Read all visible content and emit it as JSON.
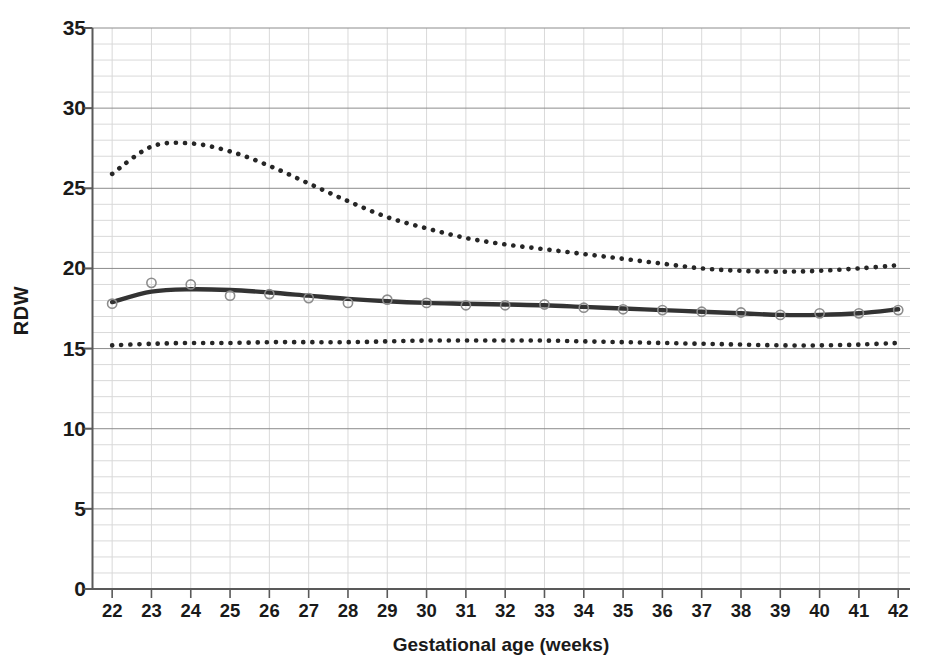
{
  "chart_data": {
    "type": "line",
    "title": "",
    "xlabel": "Gestational age (weeks)",
    "ylabel": "RDW",
    "xlim": [
      21.5,
      42.3
    ],
    "ylim": [
      0,
      35
    ],
    "xtick_labels": [
      "22",
      "23",
      "24",
      "25",
      "26",
      "27",
      "28",
      "29",
      "30",
      "31",
      "32",
      "33",
      "34",
      "35",
      "36",
      "37",
      "38",
      "39",
      "40",
      "41",
      "42"
    ],
    "ytick_labels": [
      "0",
      "5",
      "10",
      "15",
      "20",
      "25",
      "30",
      "35"
    ],
    "xticks": [
      22,
      23,
      24,
      25,
      26,
      27,
      28,
      29,
      30,
      31,
      32,
      33,
      34,
      35,
      36,
      37,
      38,
      39,
      40,
      41,
      42
    ],
    "yticks": [
      0,
      5,
      10,
      15,
      20,
      25,
      30,
      35
    ],
    "grid": true,
    "grid_major_step": 5,
    "grid_minor_step": 1,
    "legend": "none",
    "x": [
      22,
      23,
      24,
      25,
      26,
      27,
      28,
      29,
      30,
      31,
      32,
      33,
      34,
      35,
      36,
      37,
      38,
      39,
      40,
      41,
      42
    ],
    "series": [
      {
        "name": "97th centile",
        "style": "dotted",
        "color": "#262626",
        "values": [
          25.9,
          27.6,
          27.8,
          27.3,
          26.4,
          25.3,
          24.2,
          23.2,
          22.5,
          21.9,
          21.5,
          21.2,
          20.9,
          20.6,
          20.3,
          20.0,
          19.85,
          19.8,
          19.85,
          20.0,
          20.2
        ]
      },
      {
        "name": "mean (50th centile)",
        "style": "solid",
        "color": "#333333",
        "values": [
          17.9,
          18.55,
          18.7,
          18.65,
          18.5,
          18.3,
          18.1,
          17.95,
          17.85,
          17.8,
          17.75,
          17.7,
          17.6,
          17.5,
          17.4,
          17.3,
          17.2,
          17.1,
          17.1,
          17.2,
          17.45
        ]
      },
      {
        "name": "3rd centile",
        "style": "dotted",
        "color": "#262626",
        "values": [
          15.2,
          15.3,
          15.35,
          15.35,
          15.4,
          15.4,
          15.4,
          15.45,
          15.5,
          15.5,
          15.5,
          15.5,
          15.45,
          15.4,
          15.35,
          15.3,
          15.25,
          15.2,
          15.2,
          15.25,
          15.35
        ]
      }
    ],
    "markers": {
      "series": "mean (50th centile)",
      "shape": "open-circle",
      "color": "#8c8c8c",
      "x": [
        22,
        23,
        24,
        25,
        26,
        27,
        28,
        29,
        30,
        31,
        32,
        33,
        34,
        35,
        36,
        37,
        38,
        39,
        40,
        41,
        42
      ],
      "values": [
        17.8,
        19.1,
        19.0,
        18.3,
        18.4,
        18.15,
        17.85,
        18.05,
        17.85,
        17.7,
        17.7,
        17.75,
        17.55,
        17.45,
        17.4,
        17.3,
        17.25,
        17.1,
        17.2,
        17.2,
        17.4
      ]
    },
    "colors": {
      "axis": "#595959",
      "grid_major": "#8c8c8c",
      "grid_minor": "#d9d9d9",
      "text": "#1a1a1a",
      "upper_band": "#262626",
      "mean_line": "#333333",
      "lower_band": "#262626",
      "marker": "#8c8c8c"
    }
  }
}
